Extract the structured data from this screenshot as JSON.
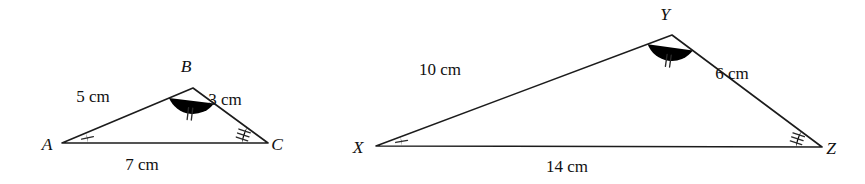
{
  "figure": {
    "type": "similar-triangles-diagram",
    "background_color": "#ffffff",
    "line_color": "#1c1c1c",
    "text_color": "#111111",
    "unit": "cm"
  },
  "triangles": [
    {
      "name": "triangle-abc",
      "vertices": [
        {
          "label": "A",
          "x": 62,
          "y": 143,
          "label_x": 47,
          "label_y": 150,
          "angle_ticks": 1
        },
        {
          "label": "B",
          "x": 193,
          "y": 88,
          "label_x": 186,
          "label_y": 72,
          "angle_ticks": 2
        },
        {
          "label": "C",
          "x": 268,
          "y": 143,
          "label_x": 277,
          "label_y": 150,
          "angle_ticks": 3
        }
      ],
      "sides": [
        {
          "name": "AB",
          "length": "5 cm",
          "value": 5,
          "label_x": 93,
          "label_y": 102
        },
        {
          "name": "BC",
          "length": "3 cm",
          "value": 3,
          "label_x": 225,
          "label_y": 105
        },
        {
          "name": "AC",
          "length": "7 cm",
          "value": 7,
          "label_x": 142,
          "label_y": 170
        }
      ]
    },
    {
      "name": "triangle-xyz",
      "vertices": [
        {
          "label": "X",
          "x": 376,
          "y": 146,
          "label_x": 358,
          "label_y": 153,
          "angle_ticks": 1
        },
        {
          "label": "Y",
          "x": 672,
          "y": 35,
          "label_x": 665,
          "label_y": 20,
          "angle_ticks": 2
        },
        {
          "label": "Z",
          "x": 822,
          "y": 147,
          "label_x": 831,
          "label_y": 154,
          "angle_ticks": 3
        }
      ],
      "sides": [
        {
          "name": "XY",
          "length": "10 cm",
          "value": 10,
          "label_x": 440,
          "label_y": 75
        },
        {
          "name": "YZ",
          "length": "6 cm",
          "value": 6,
          "label_x": 732,
          "label_y": 79
        },
        {
          "name": "XZ",
          "length": "14 cm",
          "value": 14,
          "label_x": 567,
          "label_y": 172
        }
      ]
    }
  ]
}
